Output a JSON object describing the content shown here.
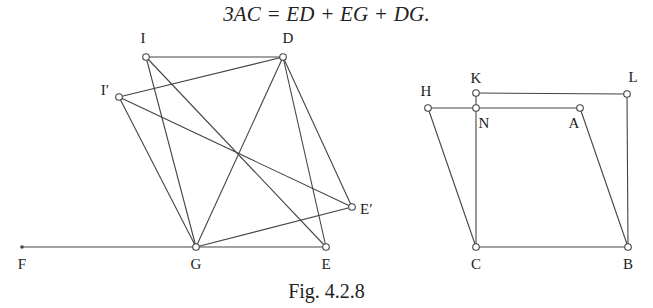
{
  "equation": "3AC = ED + EG + DG.",
  "caption": "Fig. 4.2.8",
  "left_figure": {
    "points": [
      {
        "id": "I",
        "label": "I"
      },
      {
        "id": "D",
        "label": "D"
      },
      {
        "id": "I2",
        "label": "I′"
      },
      {
        "id": "G",
        "label": "G"
      },
      {
        "id": "E",
        "label": "E"
      },
      {
        "id": "E2",
        "label": "E′"
      },
      {
        "id": "F",
        "label": "F"
      }
    ],
    "segments": [
      [
        "I",
        "D"
      ],
      [
        "I",
        "G"
      ],
      [
        "I",
        "E"
      ],
      [
        "D",
        "G"
      ],
      [
        "D",
        "E"
      ],
      [
        "D",
        "E2"
      ],
      [
        "I2",
        "D"
      ],
      [
        "I2",
        "G"
      ],
      [
        "I2",
        "E2"
      ],
      [
        "G",
        "E2"
      ],
      [
        "F",
        "E"
      ]
    ]
  },
  "right_figure": {
    "points": [
      {
        "id": "K",
        "label": "K"
      },
      {
        "id": "L",
        "label": "L"
      },
      {
        "id": "H",
        "label": "H"
      },
      {
        "id": "N",
        "label": "N"
      },
      {
        "id": "A",
        "label": "A"
      },
      {
        "id": "C",
        "label": "C"
      },
      {
        "id": "B",
        "label": "B"
      }
    ],
    "segments": [
      [
        "K",
        "L"
      ],
      [
        "L",
        "B"
      ],
      [
        "C",
        "B"
      ],
      [
        "K",
        "C"
      ],
      [
        "H",
        "A"
      ],
      [
        "H",
        "C"
      ],
      [
        "A",
        "B"
      ]
    ]
  }
}
